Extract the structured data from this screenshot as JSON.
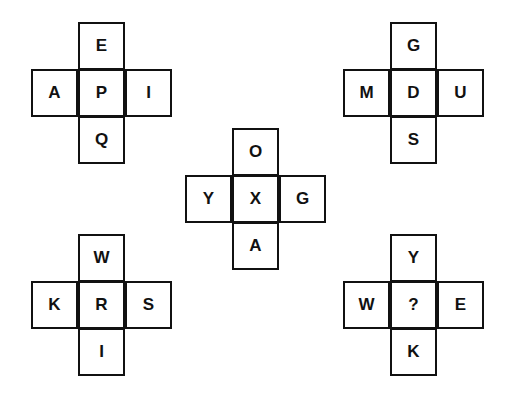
{
  "puzzle": {
    "crosses": [
      {
        "id": "top-left",
        "x": 31,
        "y": 22,
        "top": "E",
        "left": "A",
        "center": "P",
        "right": "I",
        "bottom": "Q"
      },
      {
        "id": "top-right",
        "x": 343,
        "y": 22,
        "top": "G",
        "left": "M",
        "center": "D",
        "right": "U",
        "bottom": "S"
      },
      {
        "id": "center",
        "x": 185,
        "y": 128,
        "top": "O",
        "left": "Y",
        "center": "X",
        "right": "G",
        "bottom": "A"
      },
      {
        "id": "bottom-left",
        "x": 31,
        "y": 234,
        "top": "W",
        "left": "K",
        "center": "R",
        "right": "S",
        "bottom": "I"
      },
      {
        "id": "bottom-right",
        "x": 343,
        "y": 234,
        "top": "Y",
        "left": "W",
        "center": "?",
        "right": "E",
        "bottom": "K"
      }
    ],
    "colors": {
      "border": "#111111",
      "text": "#111111",
      "background": "#ffffff"
    }
  }
}
